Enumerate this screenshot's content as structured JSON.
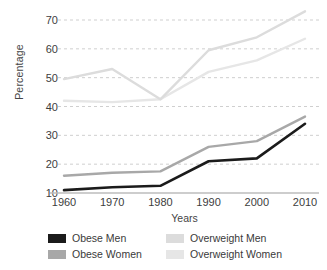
{
  "chart_data": {
    "type": "line",
    "title": "",
    "xlabel": "Years",
    "ylabel": "Percentage",
    "categories": [
      1960,
      1970,
      1980,
      1990,
      2000,
      2010
    ],
    "xticklabels": [
      "1960",
      "1970",
      "1980",
      "1990",
      "2000",
      "2010"
    ],
    "yticklabels": [
      "10",
      "20",
      "30",
      "40",
      "50",
      "60",
      "70"
    ],
    "yticks": [
      10,
      20,
      30,
      40,
      50,
      60,
      70
    ],
    "ylim": [
      10,
      74
    ],
    "xlim": [
      1960,
      2010
    ],
    "grid": "horizontal-dashed",
    "legend_position": "below-axes",
    "series": [
      {
        "name": "Obese Men",
        "color": "#1b1b1b",
        "values": [
          11,
          12,
          12.5,
          21,
          22,
          34
        ]
      },
      {
        "name": "Obese Women",
        "color": "#a8a8a8",
        "values": [
          16,
          17,
          17.5,
          26,
          28,
          36.5
        ]
      },
      {
        "name": "Overweight Men",
        "color": "#dcdcdc",
        "values": [
          49.5,
          53,
          42.5,
          59.5,
          64,
          73
        ]
      },
      {
        "name": "Overweight Women",
        "color": "#e6e6e6",
        "values": [
          42,
          41.5,
          42.5,
          52,
          56,
          63.5
        ]
      }
    ]
  },
  "legend": {
    "items": [
      {
        "label": "Obese Men",
        "color": "#1b1b1b"
      },
      {
        "label": "Overweight Men",
        "color": "#dcdcdc"
      },
      {
        "label": "Obese Women",
        "color": "#a8a8a8"
      },
      {
        "label": "Overweight Women",
        "color": "#e6e6e6"
      }
    ]
  },
  "colors": {
    "background": "#ffffff",
    "grid": "#c9c9c9",
    "axis": "#bdbdbd",
    "text": "#3a3a3a"
  }
}
